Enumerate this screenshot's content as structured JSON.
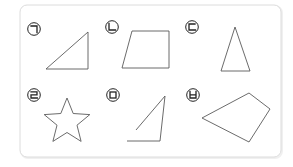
{
  "colors": {
    "panel_border": "#dcdcdc",
    "shape_stroke": "#5a5a5a",
    "label_stroke": "#222222",
    "background": "#ffffff"
  },
  "figures": [
    {
      "label": "ㄱ",
      "description": "right triangle",
      "label_pos": {
        "cx": 34,
        "cy": 29
      },
      "type": "polygon",
      "points": "46,69 88,32 88,69"
    },
    {
      "label": "ㄴ",
      "description": "trapezoid",
      "label_pos": {
        "cx": 112,
        "cy": 27
      },
      "type": "polygon",
      "points": "132,31 169,31 169,68 122,68"
    },
    {
      "label": "ㄷ",
      "description": "isosceles triangle",
      "label_pos": {
        "cx": 192,
        "cy": 27
      },
      "type": "polygon",
      "points": "235,27 221,71 250,71"
    },
    {
      "label": "ㄹ",
      "description": "five-pointed star",
      "label_pos": {
        "cx": 34,
        "cy": 95
      },
      "type": "polygon",
      "points": "67,98 73.2,113.5 89.8,114.6 77,125.2 81.1,141.4 67,132.5 52.9,141.4 57,125.2 44.2,114.6 60.8,113.5"
    },
    {
      "label": "ㅁ",
      "description": "open figure (not closed)",
      "label_pos": {
        "cx": 113,
        "cy": 95
      },
      "type": "polyline",
      "points": "136,130 165,96 160,141 127,141"
    },
    {
      "label": "ㅂ",
      "description": "quadrilateral",
      "label_pos": {
        "cx": 193,
        "cy": 95
      },
      "type": "polygon",
      "points": "249,93 270,109 249,142 202,118"
    }
  ]
}
